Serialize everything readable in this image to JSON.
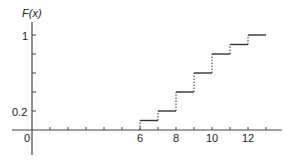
{
  "chart_data": {
    "type": "line",
    "subtype": "step-cdf",
    "title": "",
    "ylabel": "F(x)",
    "xlabel": "",
    "xlim": [
      0,
      13
    ],
    "ylim": [
      0,
      1
    ],
    "x_ticks": [
      1,
      2,
      3,
      4,
      5,
      6,
      7,
      8,
      9,
      10,
      11,
      12,
      13
    ],
    "x_tick_labels": {
      "0": "0",
      "6": "6",
      "8": "8",
      "10": "10",
      "12": "12"
    },
    "y_ticks": [
      0.2,
      0.4,
      0.6,
      0.8,
      1.0
    ],
    "y_tick_labels": {
      "0.2": "0.2",
      "1": "1"
    },
    "steps": [
      {
        "x_start": 6,
        "x_end": 7,
        "y": 0.1
      },
      {
        "x_start": 7,
        "x_end": 8,
        "y": 0.2
      },
      {
        "x_start": 8,
        "x_end": 9,
        "y": 0.4
      },
      {
        "x_start": 9,
        "x_end": 10,
        "y": 0.6
      },
      {
        "x_start": 10,
        "x_end": 11,
        "y": 0.8
      },
      {
        "x_start": 11,
        "x_end": 12,
        "y": 0.9
      },
      {
        "x_start": 12,
        "x_end": 13,
        "y": 1.0
      }
    ],
    "grid": false,
    "legend": null
  },
  "labels": {
    "y_axis_title": "F(x)",
    "y_one": "1",
    "y_point_two": "0.2",
    "x_zero": "0",
    "x_six": "6",
    "x_eight": "8",
    "x_ten": "10",
    "x_twelve": "12"
  },
  "colors": {
    "line": "#333333",
    "axis": "#444444",
    "background": "#ffffff"
  }
}
